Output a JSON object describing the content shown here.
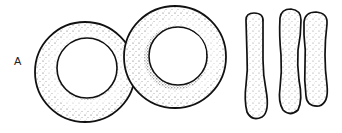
{
  "figure": {
    "panel_label": "A",
    "views": [
      {
        "name": "face-on cells",
        "count": 2
      },
      {
        "name": "side-profile cells",
        "count": 3
      }
    ],
    "colors": {
      "outline": "#111111",
      "stipple": "#222222",
      "background": "#ffffff"
    }
  }
}
